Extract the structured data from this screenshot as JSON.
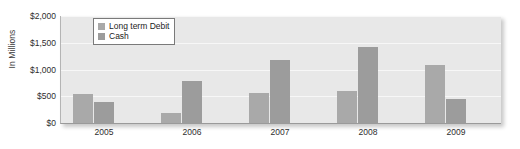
{
  "chart_data": {
    "type": "bar",
    "title": "",
    "xlabel": "",
    "ylabel": "In Millions",
    "categories": [
      "2005",
      "2006",
      "2007",
      "2008",
      "2009"
    ],
    "series": [
      {
        "name": "Long term Debit",
        "color": "#a9a9a9",
        "values": [
          540,
          180,
          570,
          600,
          1080
        ]
      },
      {
        "name": "Cash",
        "color": "#9c9c9c",
        "values": [
          400,
          790,
          1180,
          1420,
          450
        ]
      }
    ],
    "ylim": [
      0,
      2000
    ],
    "ytick_values": [
      0,
      500,
      1000,
      1500,
      2000
    ],
    "ytick_labels": [
      "$0",
      "$500",
      "$1,000",
      "$1,500",
      "$2,000"
    ],
    "grid": true,
    "legend_position": "top-left-inside"
  },
  "legend": {
    "items": [
      {
        "label": "Long term Debit"
      },
      {
        "label": "Cash"
      }
    ]
  },
  "colors": {
    "plot_background": "#e8e8e8",
    "gridline": "#f7f7f7",
    "series_long_term_debit": "#a9a9a9",
    "series_cash": "#9c9c9c"
  }
}
